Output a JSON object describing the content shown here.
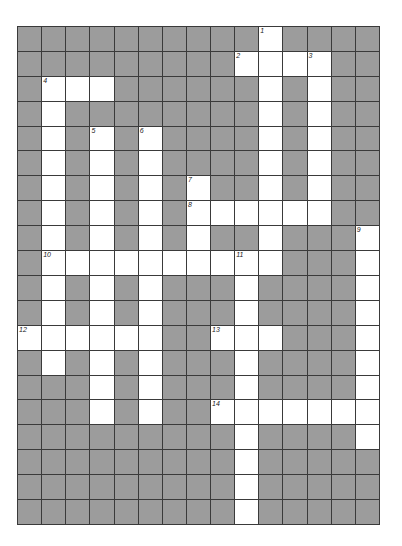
{
  "puzzle": {
    "title": "",
    "rows": 20,
    "cols": 15,
    "colors": {
      "block": "#9c9c9c",
      "open": "#ffffff",
      "gridline": "#3a3a3a",
      "number": "#222222"
    },
    "open_cells": [
      [
        0,
        10
      ],
      [
        1,
        9
      ],
      [
        1,
        10
      ],
      [
        1,
        11
      ],
      [
        1,
        12
      ],
      [
        2,
        1
      ],
      [
        2,
        2
      ],
      [
        2,
        3
      ],
      [
        2,
        10
      ],
      [
        2,
        12
      ],
      [
        3,
        1
      ],
      [
        3,
        10
      ],
      [
        3,
        12
      ],
      [
        4,
        1
      ],
      [
        4,
        3
      ],
      [
        4,
        5
      ],
      [
        4,
        10
      ],
      [
        4,
        12
      ],
      [
        5,
        1
      ],
      [
        5,
        3
      ],
      [
        5,
        5
      ],
      [
        5,
        10
      ],
      [
        5,
        12
      ],
      [
        6,
        1
      ],
      [
        6,
        3
      ],
      [
        6,
        5
      ],
      [
        6,
        7
      ],
      [
        6,
        10
      ],
      [
        6,
        12
      ],
      [
        7,
        1
      ],
      [
        7,
        3
      ],
      [
        7,
        5
      ],
      [
        7,
        7
      ],
      [
        7,
        8
      ],
      [
        7,
        9
      ],
      [
        7,
        10
      ],
      [
        7,
        11
      ],
      [
        7,
        12
      ],
      [
        8,
        1
      ],
      [
        8,
        3
      ],
      [
        8,
        5
      ],
      [
        8,
        7
      ],
      [
        8,
        10
      ],
      [
        8,
        14
      ],
      [
        9,
        1
      ],
      [
        9,
        2
      ],
      [
        9,
        3
      ],
      [
        9,
        4
      ],
      [
        9,
        5
      ],
      [
        9,
        6
      ],
      [
        9,
        7
      ],
      [
        9,
        8
      ],
      [
        9,
        9
      ],
      [
        9,
        10
      ],
      [
        9,
        14
      ],
      [
        10,
        1
      ],
      [
        10,
        3
      ],
      [
        10,
        5
      ],
      [
        10,
        9
      ],
      [
        10,
        14
      ],
      [
        11,
        1
      ],
      [
        11,
        3
      ],
      [
        11,
        5
      ],
      [
        11,
        9
      ],
      [
        11,
        14
      ],
      [
        12,
        0
      ],
      [
        12,
        1
      ],
      [
        12,
        2
      ],
      [
        12,
        3
      ],
      [
        12,
        4
      ],
      [
        12,
        5
      ],
      [
        12,
        8
      ],
      [
        12,
        9
      ],
      [
        12,
        10
      ],
      [
        12,
        14
      ],
      [
        13,
        1
      ],
      [
        13,
        3
      ],
      [
        13,
        5
      ],
      [
        13,
        9
      ],
      [
        13,
        14
      ],
      [
        14,
        3
      ],
      [
        14,
        5
      ],
      [
        14,
        9
      ],
      [
        14,
        14
      ],
      [
        15,
        3
      ],
      [
        15,
        5
      ],
      [
        15,
        8
      ],
      [
        15,
        9
      ],
      [
        15,
        10
      ],
      [
        15,
        11
      ],
      [
        15,
        12
      ],
      [
        15,
        13
      ],
      [
        15,
        14
      ],
      [
        16,
        9
      ],
      [
        16,
        14
      ],
      [
        17,
        9
      ],
      [
        18,
        9
      ],
      [
        19,
        9
      ]
    ],
    "clue_numbers": [
      {
        "number": "1",
        "row": 0,
        "col": 10
      },
      {
        "number": "2",
        "row": 1,
        "col": 9
      },
      {
        "number": "3",
        "row": 1,
        "col": 12
      },
      {
        "number": "4",
        "row": 2,
        "col": 1
      },
      {
        "number": "5",
        "row": 4,
        "col": 3
      },
      {
        "number": "6",
        "row": 4,
        "col": 5
      },
      {
        "number": "7",
        "row": 6,
        "col": 7
      },
      {
        "number": "8",
        "row": 7,
        "col": 7
      },
      {
        "number": "9",
        "row": 8,
        "col": 14
      },
      {
        "number": "10",
        "row": 9,
        "col": 1
      },
      {
        "number": "11",
        "row": 9,
        "col": 9
      },
      {
        "number": "12",
        "row": 12,
        "col": 0
      },
      {
        "number": "13",
        "row": 12,
        "col": 8
      },
      {
        "number": "14",
        "row": 15,
        "col": 8
      }
    ]
  }
}
